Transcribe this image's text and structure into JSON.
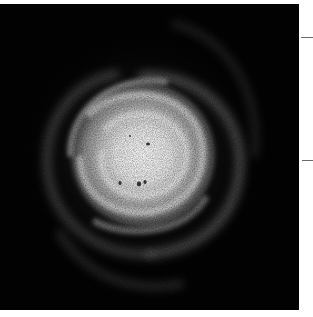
{
  "image": {
    "subject": "spiral galaxy, face-on, grayscale photograph",
    "background_color": "#030303",
    "core_color": "#f2f2f2",
    "arm_color": "#9a9a9a"
  },
  "margin_marks": [
    {
      "y": 37
    },
    {
      "y": 160
    }
  ]
}
